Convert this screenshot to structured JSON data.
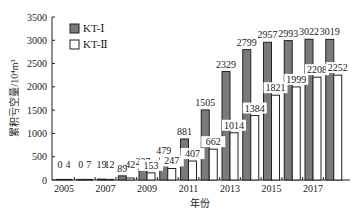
{
  "chart_data": {
    "type": "bar",
    "title": "",
    "xlabel": "年份",
    "ylabel": "累积亏空量/10⁴m³",
    "ylim": [
      0,
      3500
    ],
    "yticks": [
      0,
      500,
      1000,
      1500,
      2000,
      2500,
      3000,
      3500
    ],
    "categories": [
      "2005",
      "2006",
      "2007",
      "2008",
      "2009",
      "2010",
      "2011",
      "2012",
      "2013",
      "2014",
      "2015",
      "2016",
      "2017",
      "2018"
    ],
    "xtick_labels": [
      "2005",
      "2007",
      "2009",
      "2011",
      "2013",
      "2015",
      "2017"
    ],
    "series": [
      {
        "name": "KT-Ⅰ",
        "color": "#7a7a7a",
        "values": [
          0,
          0,
          19,
          89,
          237,
          479,
          881,
          1505,
          2329,
          2799,
          2957,
          2993,
          3022,
          3019
        ]
      },
      {
        "name": "KT-Ⅱ",
        "color": "#ffffff",
        "values": [
          4,
          7,
          12,
          42,
          153,
          247,
          407,
          662,
          1014,
          1384,
          1821,
          1999,
          2208,
          2252
        ]
      }
    ],
    "legend": {
      "position": "upper-left",
      "entries": [
        "KT-Ⅰ",
        "KT-Ⅱ"
      ]
    },
    "grid": false,
    "data_labels": true
  }
}
